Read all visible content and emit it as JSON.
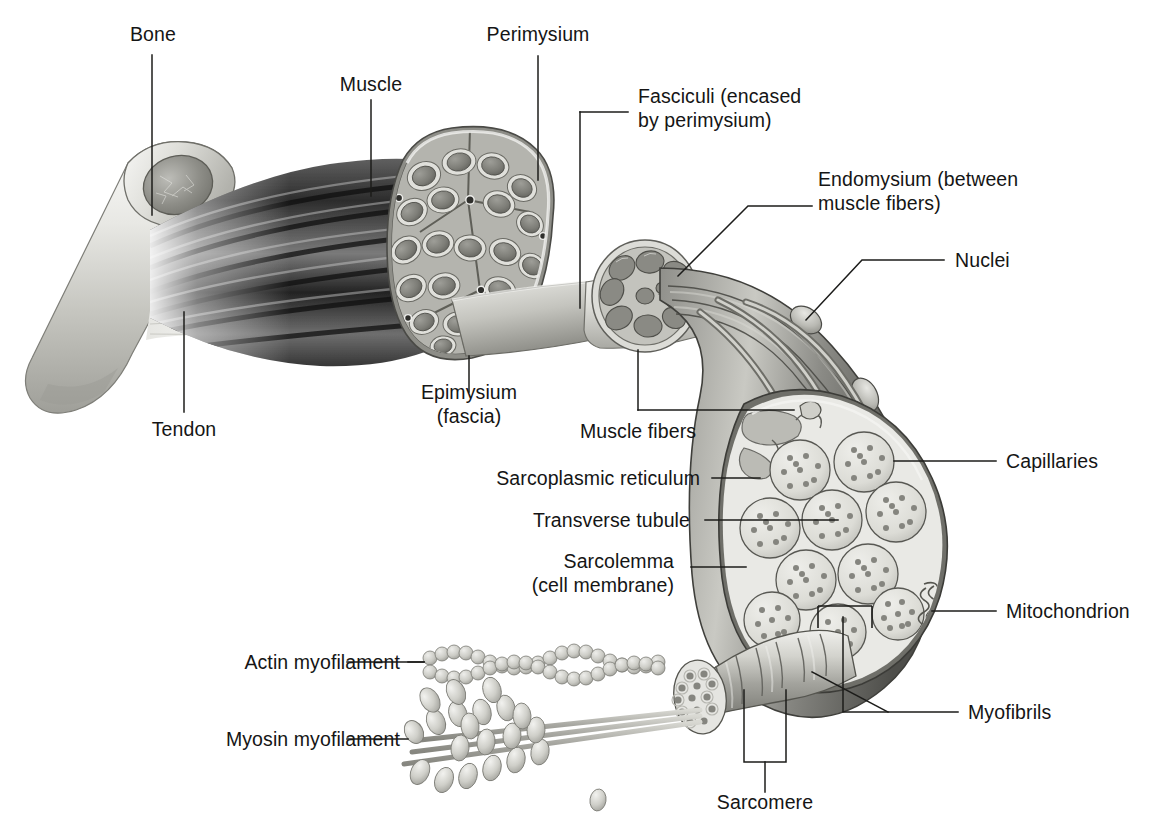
{
  "figure": {
    "type": "anatomical-diagram",
    "background_color": "#ffffff",
    "text_color": "#151515",
    "leader_line_color": "#1a1a1a"
  },
  "labels": {
    "bone": "Bone",
    "muscle": "Muscle",
    "perimysium": "Perimysium",
    "fasciculi_line1": "Fasciculi (encased",
    "fasciculi_line2": "by perimysium)",
    "endomysium_line1": "Endomysium (between",
    "endomysium_line2": "muscle fibers)",
    "nuclei": "Nuclei",
    "epimysium_line1": "Epimysium",
    "epimysium_line2": "(fascia)",
    "tendon": "Tendon",
    "muscle_fibers": "Muscle fibers",
    "capillaries": "Capillaries",
    "sarcoplasmic_reticulum": "Sarcoplasmic reticulum",
    "transverse_tubule": "Transverse tubule",
    "sarcolemma_line1": "Sarcolemma",
    "sarcolemma_line2": "(cell membrane)",
    "mitochondrion": "Mitochondrion",
    "myofibrils": "Myofibrils",
    "actin": "Actin myofilament",
    "myosin": "Myosin myofilament",
    "sarcomere": "Sarcomere"
  },
  "structures": [
    {
      "name": "bone",
      "description": "long bone cut away showing marrow cavity"
    },
    {
      "name": "tendon",
      "description": "pale fibrous band joining muscle to bone"
    },
    {
      "name": "muscle-belly",
      "description": "dark striated muscle belly"
    },
    {
      "name": "muscle-cross-section",
      "description": "whole muscle cross-section showing fasciculi"
    },
    {
      "name": "fascicle",
      "description": "single fasciculus cut showing muscle fibers"
    },
    {
      "name": "muscle-fiber",
      "description": "single muscle fiber with nuclei and capillaries"
    },
    {
      "name": "fiber-cross-section",
      "description": "fiber cross-section showing myofibrils"
    },
    {
      "name": "myofibril",
      "description": "banded myofibril cylinder"
    },
    {
      "name": "actin-myofilament",
      "description": "double helix bead strand"
    },
    {
      "name": "myosin-myofilament",
      "description": "rod with projecting heads"
    }
  ],
  "palette": {
    "paper": "#ffffff",
    "ink": "#151515",
    "bone_light": "#efefec",
    "bone_mid": "#c9c9c4",
    "bone_dark": "#9b9b95",
    "muscle_dark": "#2a2a2a",
    "muscle_mid": "#6d6d6d",
    "tissue_light": "#e3e3df",
    "tissue_mid": "#a8a8a2",
    "tissue_dark": "#6f6f6a"
  }
}
